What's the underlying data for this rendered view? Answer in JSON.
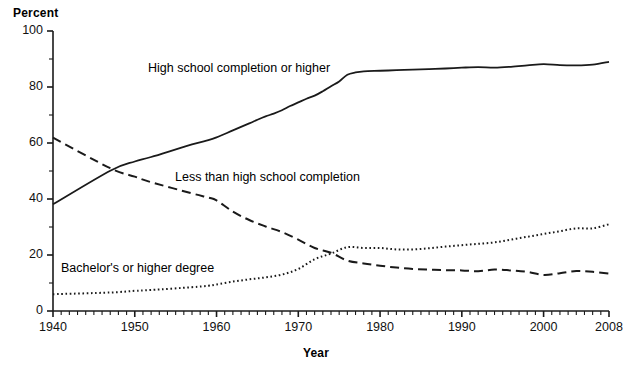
{
  "chart_data": {
    "type": "line",
    "title": "",
    "xlabel": "Year",
    "ylabel": "Percent",
    "xlim": [
      1940,
      2008
    ],
    "ylim": [
      0,
      100
    ],
    "ytick_labels": [
      "0",
      "20",
      "40",
      "60",
      "80",
      "100"
    ],
    "ytick_values": [
      0,
      20,
      40,
      60,
      80,
      100
    ],
    "yminor_step": 10,
    "xtick_labels": [
      "1940",
      "1950",
      "1960",
      "1970",
      "1980",
      "1990",
      "2000",
      "2008"
    ],
    "xtick_values": [
      1940,
      1950,
      1960,
      1970,
      1980,
      1990,
      2000,
      2008
    ],
    "xminor_step": 1,
    "grid": false,
    "legend_position": "inline-annotations",
    "series": [
      {
        "name": "High school completion or higher",
        "style": "solid",
        "color": "#1a1a1a",
        "label_anchor": {
          "x": 1952,
          "y": 79
        },
        "x": [
          1940,
          1947,
          1950,
          1952,
          1957,
          1959,
          1960,
          1962,
          1964,
          1965,
          1966,
          1967,
          1968,
          1969,
          1970,
          1971,
          1972,
          1973,
          1974,
          1975,
          1976,
          1977,
          1978,
          1980,
          1982,
          1984,
          1986,
          1988,
          1990,
          1992,
          1994,
          1996,
          1998,
          2000,
          2002,
          2004,
          2006,
          2008
        ],
        "y": [
          38.1,
          50.1,
          53.4,
          55.0,
          59.5,
          61.0,
          62.0,
          64.5,
          67.0,
          68.3,
          69.5,
          70.5,
          71.7,
          73.2,
          74.5,
          75.8,
          76.9,
          78.5,
          80.3,
          82.0,
          84.4,
          85.2,
          85.6,
          85.8,
          86.0,
          86.2,
          86.4,
          86.6,
          86.9,
          87.1,
          86.9,
          87.2,
          87.7,
          88.2,
          87.8,
          87.7,
          88.0,
          89.0
        ]
      },
      {
        "name": "Less than high school completion",
        "style": "dashed",
        "color": "#1a1a1a",
        "label_anchor": {
          "x": 1955,
          "y": 30
        },
        "x": [
          1940,
          1947,
          1950,
          1952,
          1957,
          1959,
          1960,
          1962,
          1964,
          1966,
          1968,
          1970,
          1972,
          1974,
          1976,
          1978,
          1980,
          1982,
          1984,
          1986,
          1988,
          1990,
          1992,
          1994,
          1996,
          1998,
          2000,
          2002,
          2004,
          2006,
          2008
        ],
        "y": [
          61.9,
          51.0,
          48.0,
          46.0,
          42.0,
          40.5,
          39.5,
          35.5,
          32.5,
          30.2,
          28.2,
          25.5,
          22.5,
          20.8,
          18.0,
          17.0,
          16.2,
          15.5,
          15.0,
          14.8,
          14.6,
          14.5,
          14.2,
          14.8,
          14.5,
          14.0,
          12.9,
          13.5,
          14.3,
          14.0,
          13.4
        ]
      },
      {
        "name": "Bachelor's or higher degree",
        "style": "dotted",
        "color": "#1a1a1a",
        "label_anchor": {
          "x": 1942,
          "y": 22
        },
        "x": [
          1940,
          1947,
          1950,
          1952,
          1957,
          1959,
          1960,
          1962,
          1964,
          1966,
          1968,
          1970,
          1972,
          1974,
          1976,
          1978,
          1980,
          1982,
          1984,
          1986,
          1988,
          1990,
          1992,
          1994,
          1996,
          1998,
          2000,
          2002,
          2004,
          2006,
          2008
        ],
        "y": [
          6.0,
          6.6,
          7.2,
          7.5,
          8.5,
          9.0,
          9.5,
          10.5,
          11.3,
          12.0,
          13.0,
          15.0,
          18.5,
          20.5,
          22.8,
          22.5,
          22.5,
          22.0,
          22.0,
          22.4,
          23.0,
          23.5,
          24.0,
          24.5,
          25.5,
          26.5,
          27.5,
          28.5,
          29.5,
          29.5,
          31.0
        ]
      }
    ]
  },
  "labels": {
    "y_axis_title": "Percent",
    "x_axis_title": "Year",
    "series_high_school": "High school completion or higher",
    "series_less_than": "Less than high school completion",
    "series_bachelors": "Bachelor's or higher degree"
  },
  "ticks": {
    "y": [
      "100",
      "80",
      "60",
      "40",
      "20",
      "0"
    ],
    "x": [
      "1940",
      "1950",
      "1960",
      "1970",
      "1980",
      "1990",
      "2000",
      "2008"
    ]
  }
}
